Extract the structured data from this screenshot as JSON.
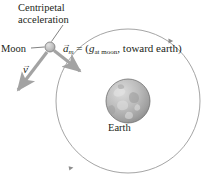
{
  "figure": {
    "background_color": "#ffffff",
    "width": 203,
    "height": 194
  },
  "labels": {
    "centripetal_acceleration": "Centripetal acceleration",
    "moon": "Moon",
    "earth": "Earth"
  },
  "equation": {
    "vector_symbol": "a",
    "vector_subscript": "m",
    "equals": "=",
    "open_paren": "(",
    "g_symbol": "g",
    "g_subscript": "at moon",
    "comma": ",",
    "direction_text": "toward earth",
    "close_paren": ")"
  },
  "velocity": {
    "symbol": "v"
  },
  "bodies": {
    "earth": {
      "name": "Earth",
      "center_x": 128,
      "center_y": 101,
      "radius": 22,
      "fill_light": "#d4d4d4",
      "fill_mid": "#b0b0b0",
      "fill_dark": "#8f8f8f",
      "stroke": "#6e6e6e"
    },
    "moon": {
      "name": "Moon",
      "center_x": 50,
      "center_y": 47,
      "radius": 5,
      "fill_light": "#d8d8d8",
      "fill_dark": "#a8a8a8",
      "stroke": "#7a7a7a"
    }
  },
  "orbit": {
    "center_x": 128,
    "center_y": 101,
    "radius": 72,
    "stroke": "#9a9a9a",
    "stroke_width": 0.9,
    "direction_markers": [
      {
        "name": "orbit-arrow-upper-right",
        "x": 170,
        "y": 41
      },
      {
        "name": "orbit-arrow-lower-left",
        "x": 71,
        "y": 168
      }
    ]
  },
  "vectors": {
    "acceleration": {
      "name": "acceleration-vector",
      "color": "#a3a3a3",
      "from_x": 54,
      "from_y": 51,
      "to_x": 83,
      "to_y": 74
    },
    "velocity": {
      "name": "velocity-vector",
      "color": "#a3a3a3",
      "from_x": 47,
      "from_y": 53,
      "to_x": 15,
      "to_y": 95
    }
  },
  "leader_line": {
    "name": "centripetal-leader-line",
    "color": "#4a4a4a",
    "from_x": 63,
    "from_y": 25,
    "to_x": 51,
    "to_y": 42
  },
  "moon_leader_line": {
    "name": "moon-leader-line",
    "color": "#4a4a4a",
    "from_x": 31,
    "from_y": 48,
    "to_x": 44,
    "to_y": 47
  }
}
